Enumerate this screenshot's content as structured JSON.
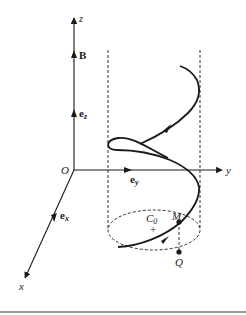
{
  "figure": {
    "axes": {
      "x_label": "x",
      "y_label": "y",
      "z_label": "z",
      "origin_label": "O"
    },
    "vectors": {
      "B": "B",
      "ez_base": "e",
      "ez_sub": "z",
      "ey_base": "e",
      "ey_sub": "y",
      "ex_base": "e",
      "ex_sub": "x"
    },
    "points": {
      "guiding_center_base": "C",
      "guiding_center_sub": "0",
      "guiding_center_marker": "+",
      "particle": "M",
      "projection": "Q"
    },
    "colors": {
      "ink": "#1a1a1a",
      "background": "#ffffff",
      "rule": "#333333"
    }
  }
}
